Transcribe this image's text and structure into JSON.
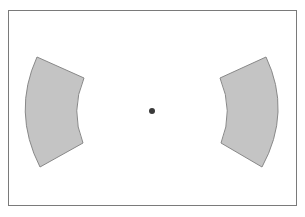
{
  "diagram": {
    "type": "annular-sectors",
    "frame": {
      "x": 8,
      "y": 10,
      "width": 288,
      "height": 195,
      "stroke": "#7a7a7a",
      "fill": "#ffffff"
    },
    "center_dot": {
      "cx": 152,
      "cy": 111,
      "r": 3,
      "fill": "#3a3a3a"
    },
    "sectors": [
      {
        "id": "left",
        "fill": "#c4c4c4",
        "stroke": "#888888",
        "path": "M 37 57 L 84 78 Q 70 111 83 143 L 40 167 Q 12 112 37 57 Z"
      },
      {
        "id": "right",
        "fill": "#c4c4c4",
        "stroke": "#888888",
        "path": "M 266 57 L 220 78 Q 234 111 221 143 L 262 167 Q 292 112 266 57 Z"
      }
    ]
  }
}
